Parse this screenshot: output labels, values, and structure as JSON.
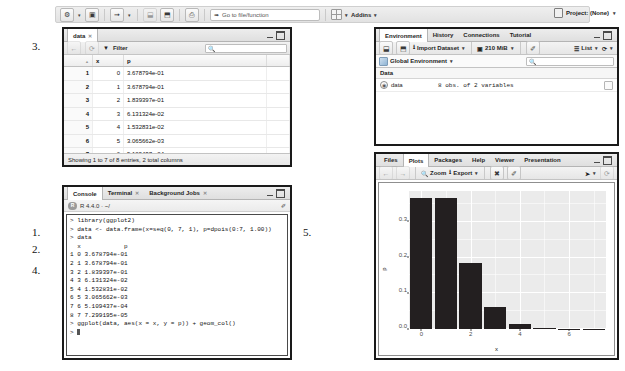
{
  "toolbar": {
    "new_file_label": "⚙",
    "new_project_label": "▣",
    "open_label": "➦",
    "save_label": "⬓",
    "save_all_label": "⬒",
    "print_label": "⎙",
    "goto_placeholder": "Go to file/function",
    "goto_value": "Go to file/function",
    "addins_label": "Addins",
    "project_label": "Project: (None)"
  },
  "data_viewer": {
    "tab_label": "data",
    "filter_label": "Filter",
    "search_value": "",
    "search_placeholder": "",
    "columns": [
      "",
      "x",
      "p"
    ],
    "rows": [
      {
        "n": "1",
        "x": "0",
        "p": "3.678794e-01"
      },
      {
        "n": "2",
        "x": "1",
        "p": "3.678794e-01"
      },
      {
        "n": "3",
        "x": "2",
        "p": "1.839397e-01"
      },
      {
        "n": "4",
        "x": "3",
        "p": "6.131324e-02"
      },
      {
        "n": "5",
        "x": "4",
        "p": "1.532831e-02"
      },
      {
        "n": "6",
        "x": "5",
        "p": "3.065662e-03"
      },
      {
        "n": "7",
        "x": "6",
        "p": "5.109437e-04"
      }
    ],
    "status": "Showing 1 to 7 of 8 entries, 2 total columns"
  },
  "environment": {
    "tabs": [
      "Environment",
      "History",
      "Connections",
      "Tutorial"
    ],
    "active_tab": "Environment",
    "import_label": "Import Dataset",
    "memory_label": "210 MiB",
    "list_label": "List",
    "scope_label": "Global Environment",
    "search_value": "",
    "section_label": "Data",
    "objects": [
      {
        "name": "data",
        "value": "8 obs. of 2 variables"
      }
    ]
  },
  "console": {
    "tabs": [
      "Console",
      "Terminal",
      "Background Jobs"
    ],
    "active_tab": "Console",
    "context_label": "R 4.4.0 · ~/",
    "lines": [
      "> library(ggplot2)",
      "> data <- data.frame(x=seq(0, 7, 1), p=dpois(0:7, 1.00))",
      "> data",
      "  x            p",
      "1 0 3.678794e-01",
      "2 1 3.678794e-01",
      "3 2 1.839397e-01",
      "4 3 6.131324e-02",
      "5 4 1.532831e-02",
      "6 5 3.065662e-03",
      "7 6 5.109437e-04",
      "8 7 7.299195e-05",
      "> ggplot(data, aes(x = x, y = p)) + geom_col()",
      "> "
    ]
  },
  "plots": {
    "tabs": [
      "Files",
      "Plots",
      "Packages",
      "Help",
      "Viewer",
      "Presentation"
    ],
    "active_tab": "Plots",
    "zoom_label": "Zoom",
    "export_label": "Export",
    "refresh_label": "⟳",
    "clear_label": "✐"
  },
  "chart_data": {
    "type": "bar",
    "title": "",
    "xlabel": "x",
    "ylabel": "p",
    "categories": [
      0,
      1,
      2,
      3,
      4,
      5,
      6,
      7
    ],
    "values": [
      0.3678794,
      0.3678794,
      0.1839397,
      0.06131324,
      0.01532831,
      0.003065662,
      0.0005109437,
      7.299195e-05
    ],
    "x_ticks": [
      "0",
      "2",
      "4",
      "6"
    ],
    "x_tick_values": [
      0,
      2,
      4,
      6
    ],
    "y_ticks": [
      "0.0",
      "0.1",
      "0.2",
      "0.3"
    ],
    "y_tick_values": [
      0.0,
      0.1,
      0.2,
      0.3
    ],
    "xlim": [
      -0.5,
      7.5
    ],
    "ylim": [
      0,
      0.3864
    ],
    "grid": true,
    "bar_color": "#231f20",
    "panel_color": "#ebebeb",
    "legend": "none"
  },
  "annotations": [
    {
      "id": "a3",
      "label": "3."
    },
    {
      "id": "a1",
      "label": "1."
    },
    {
      "id": "a2",
      "label": "2."
    },
    {
      "id": "a4",
      "label": "4."
    },
    {
      "id": "a5",
      "label": "5."
    }
  ]
}
